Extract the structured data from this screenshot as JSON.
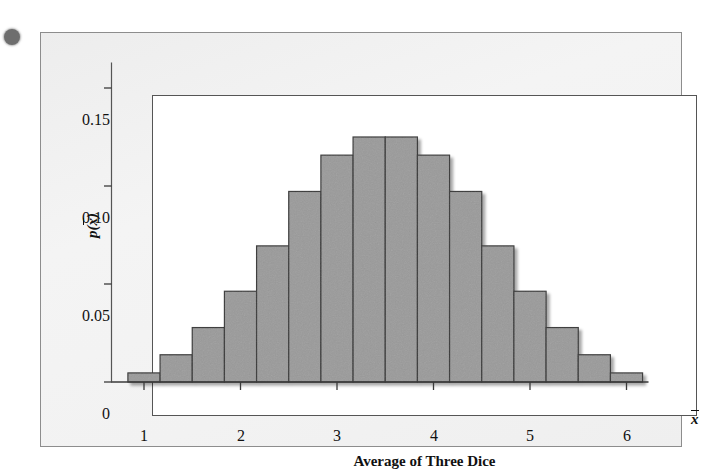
{
  "figure": {
    "background_color": "#f1f1f1",
    "frame_color": "#8d8d8d",
    "plot_background": "#ffffff",
    "plot_frame_color": "#555555",
    "bar_fill_color": "#9a9a9a",
    "bar_edge_color": "#3a3a3a",
    "corner_dot_color": "#6e6e6e"
  },
  "chart_data": {
    "type": "bar",
    "title": "",
    "subtitle": "",
    "xlabel": "Average of Three Dice",
    "ylabel": "p(x̄)",
    "x_axis_variable": "x̄",
    "grid": false,
    "legend": null,
    "xlim": [
      0.8333,
      6.1667
    ],
    "ylim": [
      0,
      0.1667
    ],
    "xticks": [
      1,
      2,
      3,
      4,
      5,
      6
    ],
    "xticklabels": [
      "1",
      "2",
      "3",
      "4",
      "5",
      "6"
    ],
    "yticks": [
      0,
      0.05,
      0.1,
      0.15
    ],
    "yticklabels": [
      "0",
      "0.05",
      "0.10",
      "0.15"
    ],
    "bar_width": 0.3333,
    "categories": [
      "1.00",
      "1.33",
      "1.67",
      "2.00",
      "2.33",
      "2.67",
      "3.00",
      "3.33",
      "3.67",
      "4.00",
      "4.33",
      "4.67",
      "5.00",
      "5.33",
      "5.67",
      "6.00"
    ],
    "x": [
      1.0,
      1.3333,
      1.6667,
      2.0,
      2.3333,
      2.6667,
      3.0,
      3.3333,
      3.6667,
      4.0,
      4.3333,
      4.6667,
      5.0,
      5.3333,
      5.6667,
      6.0
    ],
    "values": [
      0.00463,
      0.01389,
      0.02778,
      0.0463,
      0.06944,
      0.09722,
      0.11574,
      0.125,
      0.125,
      0.11574,
      0.09722,
      0.06944,
      0.0463,
      0.02778,
      0.01389,
      0.00463
    ],
    "counts_out_of_216": [
      1,
      3,
      6,
      10,
      15,
      21,
      25,
      27,
      27,
      25,
      21,
      15,
      10,
      6,
      3,
      1
    ]
  },
  "axis_labels": {
    "y_tick_0": "0",
    "y_tick_1": "0.05",
    "y_tick_2": "0.10",
    "y_tick_3": "0.15",
    "x_tick_1": "1",
    "x_tick_2": "2",
    "x_tick_3": "3",
    "x_tick_4": "4",
    "x_tick_5": "5",
    "x_tick_6": "6",
    "x_title": "Average of Three Dice",
    "y_title_p": "p",
    "y_title_open": "(",
    "y_title_x": "x",
    "y_title_close": ")",
    "x_var": "x"
  }
}
